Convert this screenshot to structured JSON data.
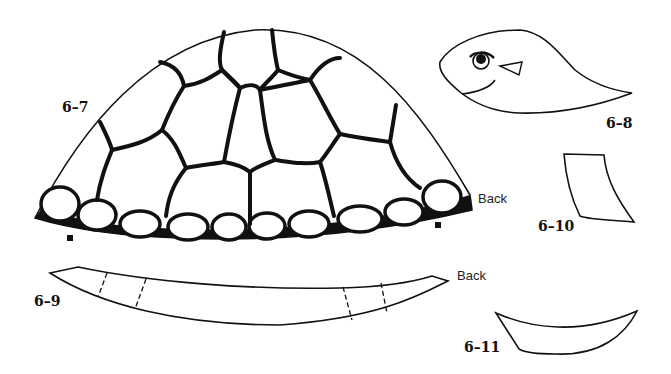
{
  "diagram": {
    "pieces": [
      {
        "id": "6-7",
        "label": "6–7",
        "description": "turtle shell (carapace) with scute pattern",
        "side_label": "Back"
      },
      {
        "id": "6-8",
        "label": "6–8",
        "description": "turtle head with eye, nose and smile"
      },
      {
        "id": "6-9",
        "label": "6–9",
        "description": "curved strip (base band) with dashed fold lines",
        "side_label": "Back"
      },
      {
        "id": "6-10",
        "label": "6–10",
        "description": "front leg / flipper piece"
      },
      {
        "id": "6-11",
        "label": "6–11",
        "description": "crescent tail piece"
      }
    ],
    "colors": {
      "ink": "#111111",
      "paper": "#ffffff"
    }
  }
}
